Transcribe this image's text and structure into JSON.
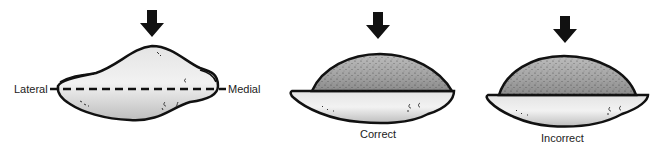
{
  "figures": [
    {
      "id": "reference",
      "labels": {
        "left": "Lateral",
        "right": "Medial"
      },
      "axis": "dashed line from lateral to medial"
    },
    {
      "id": "correct",
      "caption": "Correct"
    },
    {
      "id": "incorrect",
      "caption": "Incorrect"
    }
  ],
  "colors": {
    "outline": "#111111",
    "base_fill": "#d6d6d6",
    "dome_fill": "#9a9a9a",
    "arrow": "#111111",
    "text": "#222222"
  }
}
